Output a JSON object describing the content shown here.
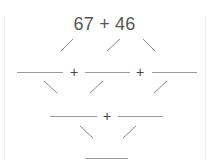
{
  "problem": {
    "expression": "67 + 46",
    "operator": "+"
  },
  "diagram": {
    "row2": {
      "blanks": [
        "",
        "",
        ""
      ],
      "operators": [
        "+",
        "+"
      ]
    },
    "row4": {
      "blanks": [
        "",
        ""
      ],
      "operators": [
        "+"
      ]
    },
    "row6": {
      "blanks": [
        ""
      ]
    },
    "line_color": "#8a8a8a",
    "text_color": "#555555"
  }
}
